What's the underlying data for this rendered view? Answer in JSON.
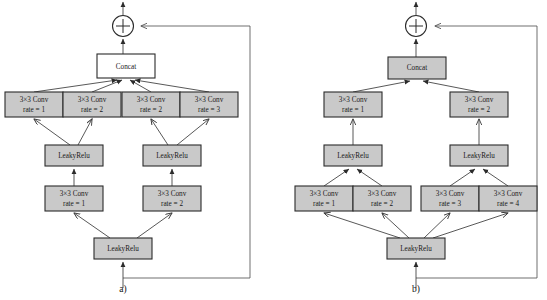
{
  "figure": {
    "colors": {
      "box_fill_gray": "#c9c9c9",
      "box_fill_white": "#ffffff",
      "box_stroke": "#2b2b2b",
      "edge_stroke": "#3a3a3a",
      "skip_stroke": "#555555",
      "background": "#ffffff"
    }
  },
  "panels": [
    {
      "caption": "a)",
      "adder": {
        "symbol": "+",
        "name": "residual-add"
      },
      "concat": {
        "label": "Concat",
        "fill": "white"
      },
      "row_top_convs": [
        {
          "line1": "3×3 Conv",
          "line2": "rate = 1"
        },
        {
          "line1": "3×3 Conv",
          "line2": "rate = 2"
        },
        {
          "line1": "3×3 Conv",
          "line2": "rate = 2"
        },
        {
          "line1": "3×3 Conv",
          "line2": "rate = 3"
        }
      ],
      "row_mid_acts": [
        {
          "label": "LeakyRelu"
        },
        {
          "label": "LeakyRelu"
        }
      ],
      "row_mid_convs": [
        {
          "line1": "3×3 Conv",
          "line2": "rate = 1"
        },
        {
          "line1": "3×3 Conv",
          "line2": "rate = 2"
        }
      ],
      "row_bottom_act": {
        "label": "LeakyRelu"
      }
    },
    {
      "caption": "b)",
      "adder": {
        "symbol": "+",
        "name": "residual-add"
      },
      "concat": {
        "label": "Concat",
        "fill": "gray"
      },
      "row_top_convs": [
        {
          "line1": "3×3 Conv",
          "line2": "rate = 1"
        },
        {
          "line1": "3×3 Conv",
          "line2": "rate = 2"
        }
      ],
      "row_mid_acts": [
        {
          "label": "LeakyRelu"
        },
        {
          "label": "LeakyRelu"
        }
      ],
      "row_bottom_convs": [
        {
          "line1": "3×3 Conv",
          "line2": "rate = 1"
        },
        {
          "line1": "3×3 Conv",
          "line2": "rate = 2"
        },
        {
          "line1": "3×3 Conv",
          "line2": "rate = 3"
        },
        {
          "line1": "3×3 Conv",
          "line2": "rate = 4"
        }
      ],
      "row_bottom_act": {
        "label": "LeakyRelu"
      }
    }
  ]
}
